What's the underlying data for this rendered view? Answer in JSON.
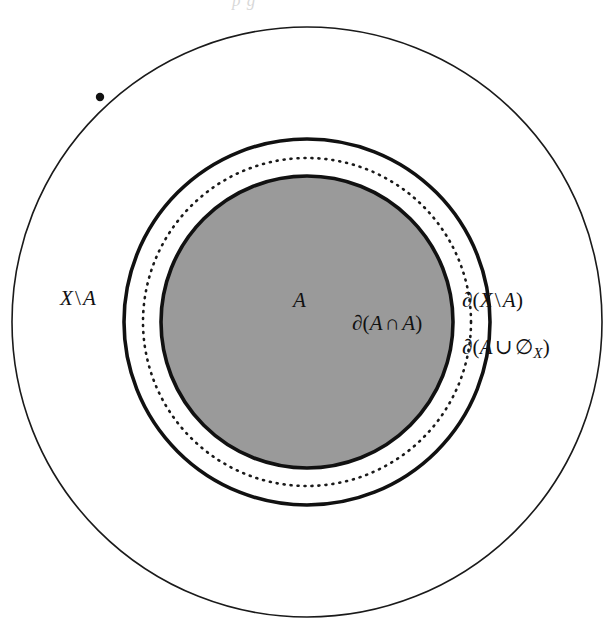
{
  "figure": {
    "kind": "set-theory-boundary-diagram",
    "background_color": "#ffffff",
    "ink_color": "#111111",
    "fill_color": "#9a9a9a",
    "top_clipped_caption": "p  g",
    "circles": [
      {
        "name": "ambient-space-boundary",
        "role": "outer boundary of the ambient space X",
        "cx": 307,
        "cy": 322,
        "r": 295,
        "stroke": "#1a1a1a",
        "stroke_width": 1.6,
        "dash": "none",
        "fill": "none"
      },
      {
        "name": "boundary-of-x-minus-a",
        "role": "thick solid circle, boundary of X\\A",
        "cx": 307,
        "cy": 322,
        "r": 183,
        "stroke": "#111111",
        "stroke_width": 3.6,
        "dash": "none",
        "fill": "none"
      },
      {
        "name": "boundary-of-a-union-empty",
        "role": "dotted circle, boundary of A union empty set of X",
        "cx": 307,
        "cy": 322,
        "r": 164,
        "stroke": "#1a1a1a",
        "stroke_width": 2.6,
        "dash": "1 6",
        "fill": "none"
      },
      {
        "name": "set-a-disk",
        "role": "shaded disk representing the set A, its rim is the boundary of A intersect A",
        "cx": 307,
        "cy": 322,
        "r": 146,
        "stroke": "#111111",
        "stroke_width": 3.6,
        "dash": "none",
        "fill": "#9a9a9a"
      }
    ],
    "point_marker": {
      "name": "point-on-outer-circle",
      "cx": 100,
      "cy": 97,
      "r": 4.2,
      "fill": "#111111"
    }
  },
  "labels": {
    "x_minus_a": {
      "id": "label-x-minus-a",
      "text": "X \\ A",
      "parts": {
        "set": "X",
        "op": "\\",
        "subset": "A"
      }
    },
    "a_region": {
      "id": "label-a-region",
      "text": "A"
    },
    "boundary_a_cap_a": {
      "id": "label-boundary-a-cap-a",
      "text": "∂(A ∩ A)",
      "parts": {
        "d": "∂",
        "open": "(",
        "left": "A",
        "op": "∩",
        "right": "A",
        "close": ")"
      }
    },
    "boundary_x_minus_a": {
      "id": "label-boundary-x-minus-a",
      "text": "∂(X \\ A)",
      "parts": {
        "d": "∂",
        "open": "(",
        "left": "X",
        "op": "\\",
        "right": "A",
        "close": ")"
      }
    },
    "boundary_a_cup_empty": {
      "id": "label-boundary-a-cup-empty",
      "text": "∂(A ∪ ∅X)",
      "parts": {
        "d": "∂",
        "open": "(",
        "left": "A",
        "op": "∪",
        "right": "∅",
        "subscript": "X",
        "close": ")"
      }
    }
  }
}
